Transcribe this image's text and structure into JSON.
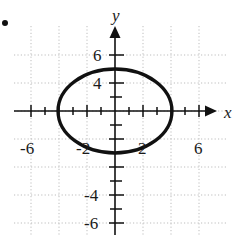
{
  "figure": {
    "bullet_marker": "•",
    "background_color": "#ffffff",
    "ink_color": "#111111",
    "grid_color": "#bdbdbd"
  },
  "chart_data": {
    "type": "line",
    "title": "",
    "subtitle": "",
    "xlabel": "x",
    "ylabel": "y",
    "xlim": [
      -7.9,
      8.4
    ],
    "ylim": [
      -8.5,
      5.9
    ],
    "grid": true,
    "grid_step": 2,
    "tick_step": 1,
    "legend": "none",
    "x_tick_labels": [
      "-6",
      "-2",
      "2",
      "6"
    ],
    "x_tick_values": [
      -6,
      -2,
      2,
      6
    ],
    "y_tick_labels": [
      "6",
      "4",
      "-4",
      "-6"
    ],
    "y_tick_values": [
      6,
      4,
      -4,
      -6
    ],
    "annotations": [],
    "series": [
      {
        "name": "ellipse",
        "shape": "ellipse",
        "center": [
          0,
          0
        ],
        "semi_axis_x": 4,
        "semi_axis_y": 3,
        "x_intercepts": [
          -4,
          4
        ],
        "y_intercepts": [
          -3,
          3
        ],
        "equation": "x^2/16 + y^2/9 = 1",
        "stroke_color": "#111111",
        "stroke_width": 3.2
      }
    ]
  },
  "axes": {
    "x_axis_arrow": "right-arrow",
    "y_axis_arrow": "up-arrow",
    "origin_px": [
      115,
      111
    ],
    "unit_px": 14
  }
}
